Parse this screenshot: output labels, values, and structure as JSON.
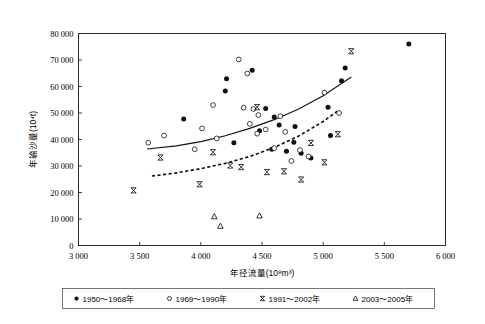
{
  "chart_data": {
    "type": "scatter",
    "title": "",
    "xlabel": "年径流量(10⁸m³)",
    "ylabel": "年输沙量(10⁴t)",
    "xlim": [
      3000,
      6000
    ],
    "ylim": [
      0,
      80000
    ],
    "xticks": [
      3000,
      3500,
      4000,
      4500,
      5000,
      5500,
      6000
    ],
    "xtick_labels": [
      "3 000",
      "3 500",
      "4 000",
      "4 500",
      "5 000",
      "5 500",
      "6 000"
    ],
    "yticks": [
      0,
      10000,
      20000,
      30000,
      40000,
      50000,
      60000,
      70000,
      80000
    ],
    "ytick_labels": [
      "0",
      "10 000",
      "20 000",
      "30 000",
      "40 000",
      "50 000",
      "60 000",
      "70 000",
      "80 000"
    ],
    "grid": false,
    "legend_position": "below-axes",
    "series": [
      {
        "name": "1950～1968年",
        "marker": "filled-circle",
        "color": "#111111",
        "points": [
          [
            3860,
            47700
          ],
          [
            4210,
            62900
          ],
          [
            4200,
            58300
          ],
          [
            4420,
            66100
          ],
          [
            4270,
            38800
          ],
          [
            4480,
            43300
          ],
          [
            4530,
            51700
          ],
          [
            4600,
            48500
          ],
          [
            4640,
            45500
          ],
          [
            4580,
            36300
          ],
          [
            4700,
            35600
          ],
          [
            4760,
            39000
          ],
          [
            4770,
            44900
          ],
          [
            4820,
            34800
          ],
          [
            4900,
            33000
          ],
          [
            5040,
            52200
          ],
          [
            5060,
            41500
          ],
          [
            5180,
            67000
          ],
          [
            5150,
            62200
          ],
          [
            5700,
            76000
          ]
        ]
      },
      {
        "name": "1969～1990年",
        "marker": "open-circle",
        "color": "#111111",
        "points": [
          [
            3570,
            38800
          ],
          [
            3700,
            41500
          ],
          [
            3950,
            36300
          ],
          [
            4010,
            44200
          ],
          [
            4100,
            53000
          ],
          [
            4130,
            40400
          ],
          [
            4310,
            70200
          ],
          [
            4380,
            64900
          ],
          [
            4350,
            52000
          ],
          [
            4400,
            45900
          ],
          [
            4430,
            51500
          ],
          [
            4470,
            49200
          ],
          [
            4460,
            42200
          ],
          [
            4530,
            43800
          ],
          [
            4600,
            36700
          ],
          [
            4650,
            48800
          ],
          [
            4690,
            42900
          ],
          [
            4740,
            31900
          ],
          [
            4810,
            36000
          ],
          [
            4880,
            33600
          ],
          [
            5010,
            57700
          ],
          [
            5130,
            50000
          ]
        ]
      },
      {
        "name": "1991～2002年",
        "marker": "cross",
        "color": "#111111",
        "points": [
          [
            3450,
            20800
          ],
          [
            3670,
            33200
          ],
          [
            3990,
            23100
          ],
          [
            4100,
            35200
          ],
          [
            4240,
            30200
          ],
          [
            4330,
            29600
          ],
          [
            4460,
            52200
          ],
          [
            4540,
            27700
          ],
          [
            4680,
            28000
          ],
          [
            4820,
            24900
          ],
          [
            4900,
            38700
          ],
          [
            5010,
            31400
          ],
          [
            5120,
            42000
          ],
          [
            5230,
            73300
          ]
        ]
      },
      {
        "name": "2003～2005年",
        "marker": "triangle",
        "color": "#111111",
        "points": [
          [
            4110,
            10900
          ],
          [
            4160,
            7300
          ],
          [
            4480,
            11200
          ]
        ]
      }
    ],
    "trendlines": [
      {
        "name": "upper-trend",
        "style": "solid",
        "x_range": [
          3560,
          5230
        ],
        "points": [
          [
            3560,
            36400
          ],
          [
            3800,
            37600
          ],
          [
            4000,
            39200
          ],
          [
            4200,
            41400
          ],
          [
            4400,
            44200
          ],
          [
            4600,
            47500
          ],
          [
            4800,
            51500
          ],
          [
            5000,
            56500
          ],
          [
            5230,
            63600
          ]
        ]
      },
      {
        "name": "lower-trend",
        "style": "dashed",
        "x_range": [
          3600,
          5120
        ],
        "points": [
          [
            3600,
            26200
          ],
          [
            3800,
            27400
          ],
          [
            4000,
            29000
          ],
          [
            4200,
            31000
          ],
          [
            4400,
            33600
          ],
          [
            4600,
            37000
          ],
          [
            4800,
            41300
          ],
          [
            5000,
            46800
          ],
          [
            5120,
            50800
          ]
        ]
      }
    ]
  },
  "legend": {
    "items": [
      {
        "label": "1950～1968年",
        "marker": "filled-circle"
      },
      {
        "label": "1969～1990年",
        "marker": "open-circle"
      },
      {
        "label": "1991～2002年",
        "marker": "cross"
      },
      {
        "label": "2003～2005年",
        "marker": "triangle"
      }
    ]
  }
}
